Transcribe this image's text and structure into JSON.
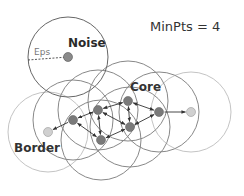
{
  "labels": {
    "minpts": "MinPts = 4",
    "noise": "Noise",
    "eps": "Eps",
    "core": "Core",
    "border": "Border"
  },
  "params": {
    "min_pts": 4
  },
  "colors": {
    "core_fill": "#7a7a7a",
    "border_fill": "#d0d0d0",
    "noise_fill": "#8a8a8a",
    "core_circle": "#888888",
    "border_circle": "#c4c4c4",
    "noise_circle": "#666666",
    "arrow": "#333333"
  },
  "eps_radius": 40,
  "points": {
    "noise": {
      "x": 68,
      "y": 57
    },
    "core": [
      {
        "id": "A",
        "x": 73,
        "y": 120
      },
      {
        "id": "B",
        "x": 98,
        "y": 110
      },
      {
        "id": "C",
        "x": 128,
        "y": 101
      },
      {
        "id": "D",
        "x": 130,
        "y": 127
      },
      {
        "id": "E",
        "x": 101,
        "y": 140
      },
      {
        "id": "F",
        "x": 159,
        "y": 112
      }
    ],
    "border": [
      {
        "id": "L",
        "x": 48,
        "y": 132
      },
      {
        "id": "R",
        "x": 191,
        "y": 112
      }
    ]
  },
  "edges": [
    {
      "from": "A",
      "to": "L",
      "type": "single"
    },
    {
      "from": "F",
      "to": "R",
      "type": "single"
    },
    {
      "from": "A",
      "to": "B",
      "type": "double"
    },
    {
      "from": "A",
      "to": "E",
      "type": "double"
    },
    {
      "from": "B",
      "to": "C",
      "type": "double"
    },
    {
      "from": "B",
      "to": "E",
      "type": "double"
    },
    {
      "from": "B",
      "to": "D",
      "type": "double"
    },
    {
      "from": "C",
      "to": "D",
      "type": "double"
    },
    {
      "from": "C",
      "to": "F",
      "type": "double"
    },
    {
      "from": "D",
      "to": "F",
      "type": "double"
    },
    {
      "from": "E",
      "to": "D",
      "type": "double"
    }
  ]
}
